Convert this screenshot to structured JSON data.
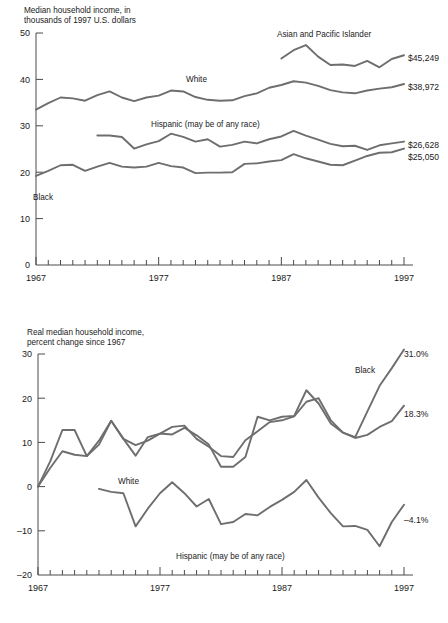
{
  "chart_data": [
    {
      "type": "line",
      "id": "median-household-income",
      "title": "Median household income, in thousands of 1997 U.S. dollars",
      "title_line1": "Median household income, in",
      "title_line2": "thousands of 1997 U.S. dollars",
      "xlabel": "",
      "ylabel": "",
      "xlim": [
        1967,
        1997
      ],
      "ylim": [
        0,
        50
      ],
      "yticks": [
        0,
        10,
        20,
        30,
        40,
        50
      ],
      "ytick_labels": [
        "0",
        "10",
        "20",
        "30",
        "40",
        "50"
      ],
      "xticks": [
        1967,
        1977,
        1987,
        1997
      ],
      "xtick_labels": [
        "1967",
        "1977",
        "1987",
        "1997"
      ],
      "minor_xticks_every": 1,
      "grid": false,
      "legend_position": "inline-annotations",
      "line_color": "#6e6e6e",
      "x": [
        1967,
        1968,
        1969,
        1970,
        1971,
        1972,
        1973,
        1974,
        1975,
        1976,
        1977,
        1978,
        1979,
        1980,
        1981,
        1982,
        1983,
        1984,
        1985,
        1986,
        1987,
        1988,
        1989,
        1990,
        1991,
        1992,
        1993,
        1994,
        1995,
        1996,
        1997
      ],
      "series": [
        {
          "name": "Asian and Pacific Islander",
          "label": "Asian and Pacific Islander",
          "end_label": "$45,249",
          "end_value": 45.249,
          "x_start": 1987,
          "values": [
            null,
            null,
            null,
            null,
            null,
            null,
            null,
            null,
            null,
            null,
            null,
            null,
            null,
            null,
            null,
            null,
            null,
            null,
            null,
            null,
            44.5,
            46.3,
            47.4,
            44.9,
            43.1,
            43.2,
            42.9,
            44.0,
            42.6,
            44.4,
            45.2
          ]
        },
        {
          "name": "White",
          "label": "White",
          "end_label": "$38,972",
          "end_value": 38.972,
          "x_start": 1967,
          "values": [
            33.5,
            34.9,
            36.1,
            35.9,
            35.4,
            36.6,
            37.4,
            36.1,
            35.3,
            36.1,
            36.5,
            37.6,
            37.4,
            36.2,
            35.6,
            35.4,
            35.5,
            36.4,
            37.0,
            38.2,
            38.8,
            39.6,
            39.3,
            38.6,
            37.7,
            37.2,
            37.0,
            37.6,
            38.0,
            38.3,
            39.0
          ]
        },
        {
          "name": "Hispanic (may be of any race)",
          "label": "Hispanic (may be of any race)",
          "end_label": "$26,628",
          "end_value": 26.628,
          "x_start": 1972,
          "values": [
            null,
            null,
            null,
            null,
            null,
            27.9,
            27.9,
            27.6,
            25.1,
            26.0,
            26.7,
            28.3,
            27.6,
            26.6,
            27.1,
            25.5,
            25.9,
            26.6,
            26.2,
            27.1,
            27.7,
            28.9,
            27.9,
            27.0,
            26.1,
            25.6,
            25.7,
            24.8,
            25.8,
            26.2,
            26.6
          ]
        },
        {
          "name": "Black",
          "label": "Black",
          "end_label": "$25,050",
          "end_value": 25.05,
          "x_start": 1967,
          "values": [
            19.2,
            20.3,
            21.5,
            21.6,
            20.3,
            21.2,
            22.0,
            21.2,
            21.0,
            21.2,
            22.0,
            21.3,
            21.0,
            19.8,
            19.9,
            19.9,
            20.0,
            21.8,
            21.9,
            22.3,
            22.6,
            23.9,
            23.0,
            22.3,
            21.6,
            21.5,
            22.5,
            23.5,
            24.2,
            24.3,
            25.1
          ]
        }
      ]
    },
    {
      "type": "line",
      "id": "real-median-household-income-percent-change",
      "title": "Real median household income, percent change since 1967",
      "title_line1": "Real median household income,",
      "title_line2": "percent change since 1967",
      "xlabel": "",
      "ylabel": "",
      "xlim": [
        1967,
        1997
      ],
      "ylim": [
        -20,
        30
      ],
      "yticks": [
        -20,
        -10,
        0,
        10,
        20,
        30
      ],
      "ytick_labels": [
        "–20",
        "–10",
        "0",
        "10",
        "20",
        "30"
      ],
      "xticks": [
        1967,
        1977,
        1987,
        1997
      ],
      "xtick_labels": [
        "1967",
        "1977",
        "1987",
        "1997"
      ],
      "minor_xticks_every": 1,
      "grid": false,
      "legend_position": "inline-annotations",
      "line_color": "#6e6e6e",
      "x": [
        1967,
        1968,
        1969,
        1970,
        1971,
        1972,
        1973,
        1974,
        1975,
        1976,
        1977,
        1978,
        1979,
        1980,
        1981,
        1982,
        1983,
        1984,
        1985,
        1986,
        1987,
        1988,
        1989,
        1990,
        1991,
        1992,
        1993,
        1994,
        1995,
        1996,
        1997
      ],
      "series": [
        {
          "name": "Black",
          "label": "Black",
          "end_label": "31.0%",
          "end_value": 31.0,
          "x_start": 1967,
          "values": [
            0,
            5.7,
            12.8,
            12.8,
            6.9,
            10.4,
            14.9,
            10.8,
            9.4,
            10.4,
            12.0,
            11.8,
            13.3,
            11.6,
            9.5,
            4.5,
            4.5,
            6.7,
            15.8,
            15.0,
            15.8,
            16.0,
            21.8,
            18.8,
            14.3,
            12.2,
            11.2,
            17.0,
            22.8,
            26.8,
            31.0
          ]
        },
        {
          "name": "White",
          "label": "White",
          "end_label": "18.3%",
          "end_value": 18.3,
          "x_start": 1967,
          "values": [
            0,
            4.2,
            8.0,
            7.2,
            6.9,
            9.5,
            14.9,
            10.8,
            7.0,
            11.2,
            12.0,
            13.5,
            13.8,
            10.8,
            9.0,
            6.9,
            6.7,
            10.5,
            12.5,
            14.6,
            15.0,
            15.9,
            19.2,
            20.0,
            15.0,
            12.2,
            11.0,
            11.7,
            13.5,
            14.8,
            18.3
          ]
        },
        {
          "name": "Hispanic (may be of any race)",
          "label": "Hispanic (may be of any race)",
          "end_label": "–4.1%",
          "end_value": -4.1,
          "x_start": 1972,
          "values": [
            null,
            null,
            null,
            null,
            null,
            -0.5,
            -1.2,
            -1.5,
            -9.0,
            -5.0,
            -1.5,
            1.0,
            -1.5,
            -4.5,
            -2.8,
            -8.5,
            -8.0,
            -6.2,
            -6.5,
            -4.6,
            -3.0,
            -1.2,
            1.5,
            -2.5,
            -6.0,
            -9.0,
            -8.9,
            -9.8,
            -13.5,
            -8.0,
            -4.1
          ]
        }
      ]
    }
  ],
  "panels": {
    "top": {
      "name": "median-income-chart",
      "title_line1": "Median household income, in",
      "title_line2": "thousands of 1997 U.S. dollars",
      "y_axis_labels": [
        "50",
        "40",
        "30",
        "20",
        "10",
        "0"
      ],
      "x_axis_labels": [
        "1967",
        "1977",
        "1987",
        "1997"
      ],
      "annotations": {
        "asian": "Asian and Pacific Islander",
        "white": "White",
        "hispanic": "Hispanic (may be of any race)",
        "black": "Black"
      },
      "end_labels": {
        "asian": "$45,249",
        "white": "$38,972",
        "hispanic": "$26,628",
        "black": "$25,050"
      }
    },
    "bottom": {
      "name": "percent-change-chart",
      "title_line1": "Real median household income,",
      "title_line2": "percent change since 1967",
      "y_axis_labels": [
        "30",
        "20",
        "10",
        "0",
        "–10",
        "–20"
      ],
      "x_axis_labels": [
        "1967",
        "1977",
        "1987",
        "1997"
      ],
      "annotations": {
        "black": "Black",
        "white": "White",
        "hispanic": "Hispanic (may be of any race)"
      },
      "end_labels": {
        "black": "31.0%",
        "white": "18.3%",
        "hispanic": "–4.1%"
      }
    }
  },
  "colors": {
    "line": "#6e6e6e",
    "axis": "#4a4a4a",
    "text": "#1a1a1a",
    "background": "#ffffff"
  }
}
